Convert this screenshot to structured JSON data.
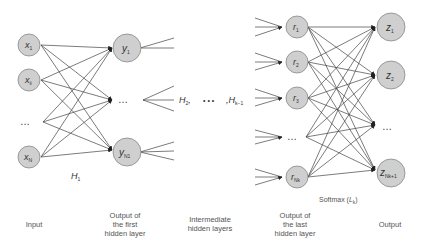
{
  "diagram": {
    "type": "feedforward-neural-network",
    "colors": {
      "node_fill": "#cfcfcf",
      "node_stroke": "#888888",
      "edge": "#444444",
      "text": "#333333",
      "caption": "#555555"
    },
    "input_layer": {
      "nodes": [
        {
          "label": "x",
          "sub": "1"
        },
        {
          "label": "x",
          "sub": "ii"
        },
        {
          "label": "…",
          "sub": ""
        },
        {
          "label": "x",
          "sub": "N"
        }
      ]
    },
    "first_hidden": {
      "nodes": [
        {
          "label": "y",
          "sub": "1"
        },
        {
          "label": "…",
          "sub": ""
        },
        {
          "label": "y",
          "sub": "N1"
        }
      ],
      "layer_label": "H",
      "layer_label_sub": "1"
    },
    "intermediate": {
      "h2": "H",
      "h2_sub": "2",
      "h2_suffix": ",",
      "dots": "• • •",
      "hk_prefix": ",",
      "hk": "H",
      "hk_sub": "k−1"
    },
    "last_hidden": {
      "nodes": [
        {
          "label": "r",
          "sub": "1"
        },
        {
          "label": "r",
          "sub": "2"
        },
        {
          "label": "r",
          "sub": "3"
        },
        {
          "label": "…",
          "sub": ""
        },
        {
          "label": "r",
          "sub": "Nk"
        }
      ]
    },
    "output_layer": {
      "nodes": [
        {
          "label": "z",
          "sub": "1"
        },
        {
          "label": "z",
          "sub": "2"
        },
        {
          "label": "…",
          "sub": ""
        },
        {
          "label": "z",
          "sub": "Nk+1"
        }
      ],
      "softmax_label": "Softmax (",
      "softmax_L": "L",
      "softmax_sub": "k",
      "softmax_close": ")"
    },
    "captions": {
      "input": "Input",
      "first_hidden_1": "Output of",
      "first_hidden_2": "the first",
      "first_hidden_3": "hidden layer",
      "intermediate_1": "Intermediate",
      "intermediate_2": "hidden layers",
      "last_hidden_1": "Output of",
      "last_hidden_2": "the last",
      "last_hidden_3": "hidden layer",
      "output": "Output"
    }
  }
}
